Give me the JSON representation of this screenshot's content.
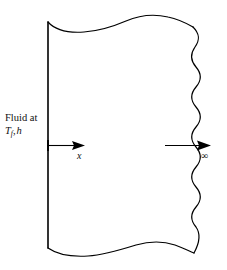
{
  "figure": {
    "name": "boundary-layer-flow-over-wall",
    "background_color": "#ffffff",
    "line_color": "#000000",
    "labels": {
      "fluid_line1": "Fluid at",
      "fluid_temperature_symbol": "T",
      "fluid_temperature_subscript": "f",
      "fluid_separator": ",",
      "fluid_coefficient_symbol": "h",
      "axis_label_x": "x",
      "far_field_label": "∞"
    },
    "elements": {
      "left_wall_name": "left-wall-line",
      "right_edge_name": "right-wavy-edge",
      "top_edge_name": "top-torn-edge",
      "bottom_edge_name": "bottom-torn-edge",
      "left_arrow_name": "x-direction-arrow",
      "right_arrow_name": "far-field-arrow"
    }
  }
}
